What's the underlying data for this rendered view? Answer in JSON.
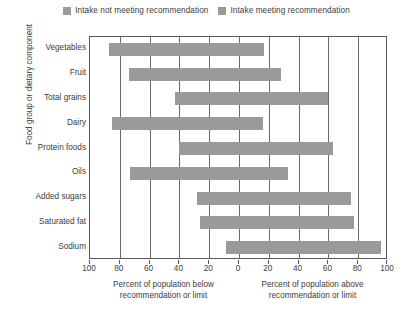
{
  "legend": {
    "entries": [
      {
        "label": "Intake not meeting recommendation",
        "color": "#9a9a9a",
        "icon": "legend-swatch"
      },
      {
        "label": "Intake meeting recommendation",
        "color": "#9a9a9a",
        "icon": "legend-swatch"
      }
    ]
  },
  "axes": {
    "y_title": "Food group or dietary component",
    "x_caption_left_line1": "Percent of population below",
    "x_caption_left_line2": "recommendation or limit",
    "x_caption_right_line1": "Percent of population above",
    "x_caption_right_line2": "recommendation or limit"
  },
  "chart_data": {
    "type": "bar",
    "orientation": "horizontal",
    "title": "",
    "xlabel": "Percent of population below recommendation or limit / Percent of population above recommendation or limit",
    "ylabel": "Food group or dietary component",
    "xlim": [
      -100,
      100
    ],
    "tick_values": [
      -100,
      -80,
      -60,
      -40,
      -20,
      0,
      20,
      40,
      60,
      80,
      100
    ],
    "tick_labels": [
      "100",
      "80",
      "60",
      "40",
      "20",
      "0",
      "20",
      "40",
      "60",
      "80",
      "100"
    ],
    "grid": true,
    "legend_position": "top-center",
    "bar_color": "#9a9a9a",
    "categories": [
      "Vegetables",
      "Fruit",
      "Total grains",
      "Dairy",
      "Protein foods",
      "Oils",
      "Added sugars",
      "Saturated fat",
      "Sodium"
    ],
    "series": [
      {
        "name": "Percent below recommendation or limit",
        "values": [
          87,
          74,
          43,
          85,
          40,
          73,
          28,
          26,
          9
        ]
      },
      {
        "name": "Percent above recommendation or limit",
        "values": [
          17,
          28,
          60,
          16,
          63,
          33,
          75,
          77,
          95
        ]
      }
    ],
    "bars": [
      {
        "category": "Vegetables",
        "below": 87,
        "above": 17
      },
      {
        "category": "Fruit",
        "below": 74,
        "above": 28
      },
      {
        "category": "Total grains",
        "below": 43,
        "above": 60
      },
      {
        "category": "Dairy",
        "below": 85,
        "above": 16
      },
      {
        "category": "Protein foods",
        "below": 40,
        "above": 63
      },
      {
        "category": "Oils",
        "below": 73,
        "above": 33
      },
      {
        "category": "Added sugars",
        "below": 28,
        "above": 75
      },
      {
        "category": "Saturated fat",
        "below": 26,
        "above": 77
      },
      {
        "category": "Sodium",
        "below": 9,
        "above": 95
      }
    ]
  }
}
